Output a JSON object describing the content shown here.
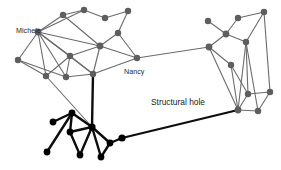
{
  "figure": {
    "background_color": "#ffffff",
    "width": 281,
    "height": 170
  },
  "palette": {
    "gray_node": "#5e5e5e",
    "black_node": "#000000",
    "gray_edge": "#6b6b6b",
    "black_edge": "#0d0d0d",
    "label_color": "#2b2b2b"
  },
  "labels": [
    {
      "id": "michele",
      "text": "Michele",
      "x": 16,
      "y": 33
    },
    {
      "id": "nancy",
      "text": "Nancy",
      "x": 124,
      "y": 74
    },
    {
      "id": "structural-hole",
      "text": "Structural hole",
      "x": 151,
      "y": 105
    }
  ],
  "chart_data": {
    "type": "scatter",
    "xlabel": "",
    "ylabel": "",
    "xlim": [
      0,
      281
    ],
    "ylim": [
      0,
      170
    ],
    "grid": false,
    "legend": "none",
    "clusters": [
      {
        "name": "upper-left-cluster",
        "color": "#5e5e5e",
        "style": "gray"
      },
      {
        "name": "lower-left-cluster",
        "color": "#000000",
        "style": "black"
      },
      {
        "name": "right-cluster",
        "color": "#5e5e5e",
        "style": "gray"
      }
    ],
    "nodes": [
      {
        "id": "n1",
        "x": 38,
        "y": 32,
        "group": "upper-left-cluster",
        "label": "Michele",
        "r": 3.4
      },
      {
        "id": "n2",
        "x": 63,
        "y": 15,
        "group": "upper-left-cluster",
        "r": 3.2
      },
      {
        "id": "n3",
        "x": 84,
        "y": 10,
        "group": "upper-left-cluster",
        "r": 3.2
      },
      {
        "id": "n4",
        "x": 105,
        "y": 18,
        "group": "upper-left-cluster",
        "r": 3.2
      },
      {
        "id": "n5",
        "x": 128,
        "y": 11,
        "group": "upper-left-cluster",
        "r": 3.2
      },
      {
        "id": "n6",
        "x": 118,
        "y": 33,
        "group": "upper-left-cluster",
        "r": 3.2
      },
      {
        "id": "n7",
        "x": 100,
        "y": 46,
        "group": "upper-left-cluster",
        "r": 3.4
      },
      {
        "id": "n8",
        "x": 70,
        "y": 56,
        "group": "upper-left-cluster",
        "r": 3.2
      },
      {
        "id": "n9",
        "x": 18,
        "y": 60,
        "group": "upper-left-cluster",
        "r": 3.2
      },
      {
        "id": "n10",
        "x": 46,
        "y": 76,
        "group": "upper-left-cluster",
        "r": 3.2
      },
      {
        "id": "n11",
        "x": 66,
        "y": 77,
        "group": "upper-left-cluster",
        "r": 3.2
      },
      {
        "id": "n12",
        "x": 137,
        "y": 58,
        "group": "upper-left-cluster",
        "label": "Nancy",
        "r": 3.2
      },
      {
        "id": "n13",
        "x": 93,
        "y": 74,
        "group": "upper-left-cluster",
        "r": 3.2
      },
      {
        "id": "b1",
        "x": 92,
        "y": 127,
        "group": "lower-left-cluster",
        "r": 3.6
      },
      {
        "id": "b2",
        "x": 72,
        "y": 113,
        "group": "lower-left-cluster",
        "r": 3.4
      },
      {
        "id": "b3",
        "x": 53,
        "y": 122,
        "group": "lower-left-cluster",
        "r": 3.4
      },
      {
        "id": "b4",
        "x": 70,
        "y": 132,
        "group": "lower-left-cluster",
        "r": 3.4
      },
      {
        "id": "b5",
        "x": 47,
        "y": 152,
        "group": "lower-left-cluster",
        "r": 3.4
      },
      {
        "id": "b6",
        "x": 80,
        "y": 155,
        "group": "lower-left-cluster",
        "r": 3.4
      },
      {
        "id": "b7",
        "x": 101,
        "y": 157,
        "group": "lower-left-cluster",
        "r": 3.4
      },
      {
        "id": "b8",
        "x": 110,
        "y": 143,
        "group": "lower-left-cluster",
        "r": 3.4
      },
      {
        "id": "b9",
        "x": 122,
        "y": 138,
        "group": "lower-left-cluster",
        "r": 3.6
      },
      {
        "id": "r1",
        "x": 208,
        "y": 21,
        "group": "right-cluster",
        "r": 3.2
      },
      {
        "id": "r2",
        "x": 238,
        "y": 18,
        "group": "right-cluster",
        "r": 3.2
      },
      {
        "id": "r3",
        "x": 264,
        "y": 12,
        "group": "right-cluster",
        "r": 3.2
      },
      {
        "id": "r4",
        "x": 226,
        "y": 34,
        "group": "right-cluster",
        "r": 3.4
      },
      {
        "id": "r5",
        "x": 209,
        "y": 47,
        "group": "right-cluster",
        "r": 3.4
      },
      {
        "id": "r6",
        "x": 246,
        "y": 42,
        "group": "right-cluster",
        "r": 3.2
      },
      {
        "id": "r7",
        "x": 231,
        "y": 65,
        "group": "right-cluster",
        "r": 3.2
      },
      {
        "id": "r8",
        "x": 248,
        "y": 94,
        "group": "right-cluster",
        "r": 3.2
      },
      {
        "id": "r9",
        "x": 270,
        "y": 92,
        "group": "right-cluster",
        "r": 3.2
      },
      {
        "id": "r10",
        "x": 238,
        "y": 110,
        "group": "right-cluster",
        "r": 3.4
      },
      {
        "id": "r11",
        "x": 258,
        "y": 111,
        "group": "right-cluster",
        "r": 3.2
      }
    ],
    "edges": [
      {
        "source": "n1",
        "target": "n2",
        "style": "gray"
      },
      {
        "source": "n2",
        "target": "n3",
        "style": "gray"
      },
      {
        "source": "n3",
        "target": "n4",
        "style": "gray"
      },
      {
        "source": "n4",
        "target": "n5",
        "style": "gray"
      },
      {
        "source": "n5",
        "target": "n6",
        "style": "gray"
      },
      {
        "source": "n6",
        "target": "n7",
        "style": "gray"
      },
      {
        "source": "n6",
        "target": "n12",
        "style": "gray"
      },
      {
        "source": "n1",
        "target": "n7",
        "style": "gray"
      },
      {
        "source": "n1",
        "target": "n8",
        "style": "gray"
      },
      {
        "source": "n1",
        "target": "n9",
        "style": "gray"
      },
      {
        "source": "n1",
        "target": "n10",
        "style": "gray"
      },
      {
        "source": "n1",
        "target": "n11",
        "style": "gray"
      },
      {
        "source": "n1",
        "target": "n13",
        "style": "gray"
      },
      {
        "source": "n1",
        "target": "n3",
        "style": "gray"
      },
      {
        "source": "n2",
        "target": "n7",
        "style": "gray"
      },
      {
        "source": "n7",
        "target": "n8",
        "style": "gray"
      },
      {
        "source": "n7",
        "target": "n12",
        "style": "gray"
      },
      {
        "source": "n7",
        "target": "n13",
        "style": "gray"
      },
      {
        "source": "n8",
        "target": "n10",
        "style": "gray"
      },
      {
        "source": "n8",
        "target": "n11",
        "style": "gray"
      },
      {
        "source": "n8",
        "target": "n13",
        "style": "gray"
      },
      {
        "source": "n9",
        "target": "n10",
        "style": "gray"
      },
      {
        "source": "n9",
        "target": "n11",
        "style": "gray"
      },
      {
        "source": "n11",
        "target": "n13",
        "style": "gray"
      },
      {
        "source": "n12",
        "target": "n13",
        "style": "gray"
      },
      {
        "source": "n10",
        "target": "b1",
        "style": "gray"
      },
      {
        "source": "n13",
        "target": "b1",
        "style": "black"
      },
      {
        "source": "n12",
        "target": "r5",
        "style": "gray"
      },
      {
        "source": "b1",
        "target": "b2",
        "style": "black"
      },
      {
        "source": "b1",
        "target": "b4",
        "style": "black"
      },
      {
        "source": "b1",
        "target": "b6",
        "style": "black"
      },
      {
        "source": "b1",
        "target": "b7",
        "style": "black"
      },
      {
        "source": "b1",
        "target": "b8",
        "style": "black"
      },
      {
        "source": "b2",
        "target": "b3",
        "style": "black"
      },
      {
        "source": "b2",
        "target": "b4",
        "style": "black"
      },
      {
        "source": "b2",
        "target": "b5",
        "style": "black"
      },
      {
        "source": "b4",
        "target": "b6",
        "style": "black"
      },
      {
        "source": "b8",
        "target": "b7",
        "style": "black"
      },
      {
        "source": "b8",
        "target": "b9",
        "style": "black"
      },
      {
        "source": "b9",
        "target": "r10",
        "style": "bridge"
      },
      {
        "source": "r1",
        "target": "r4",
        "style": "gray"
      },
      {
        "source": "r2",
        "target": "r4",
        "style": "gray"
      },
      {
        "source": "r2",
        "target": "r3",
        "style": "gray"
      },
      {
        "source": "r3",
        "target": "r6",
        "style": "gray"
      },
      {
        "source": "r4",
        "target": "r5",
        "style": "gray"
      },
      {
        "source": "r4",
        "target": "r6",
        "style": "gray"
      },
      {
        "source": "r5",
        "target": "r7",
        "style": "gray"
      },
      {
        "source": "r5",
        "target": "r10",
        "style": "gray"
      },
      {
        "source": "r6",
        "target": "r8",
        "style": "gray"
      },
      {
        "source": "r6",
        "target": "r10",
        "style": "gray"
      },
      {
        "source": "r6",
        "target": "r11",
        "style": "gray"
      },
      {
        "source": "r3",
        "target": "r9",
        "style": "gray"
      },
      {
        "source": "r7",
        "target": "r8",
        "style": "gray"
      },
      {
        "source": "r7",
        "target": "r10",
        "style": "gray"
      },
      {
        "source": "r8",
        "target": "r9",
        "style": "gray"
      },
      {
        "source": "r8",
        "target": "r10",
        "style": "gray"
      },
      {
        "source": "r9",
        "target": "r11",
        "style": "gray"
      },
      {
        "source": "r10",
        "target": "r11",
        "style": "gray"
      }
    ]
  }
}
